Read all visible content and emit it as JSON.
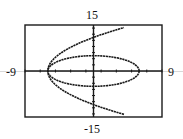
{
  "chart_data": {
    "type": "line",
    "title": "",
    "xlabel": "",
    "ylabel": "",
    "xlim": [
      -9,
      9
    ],
    "ylim": [
      -15,
      15
    ],
    "grid": false,
    "window_labels": {
      "top": "15",
      "bottom": "-15",
      "left": "-9",
      "right": "9"
    },
    "x_tick_step": 2,
    "y_tick_step": 2,
    "series": [
      {
        "name": "ellipse",
        "equation": "x^2/36 + y^2/25 = 1",
        "a": 6,
        "b": 5
      },
      {
        "name": "parabola",
        "equation": "y^2 = 20(x + 6)",
        "vertex": [
          -6,
          0
        ],
        "k": 20,
        "x_max": 4
      }
    ],
    "colors": {
      "curve": "#1a1a1a",
      "frame": "#1a1a1a"
    }
  }
}
